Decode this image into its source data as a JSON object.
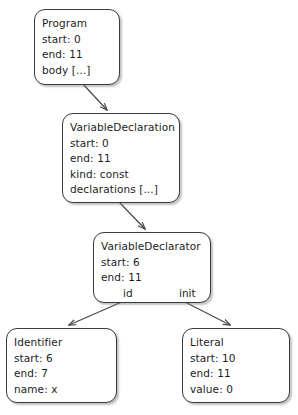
{
  "diagram": {
    "type": "abstract-syntax-tree",
    "title": "",
    "background_color": "#ffffff",
    "node_border_color": "#3a3a3a",
    "text_color": "#1c1c1c",
    "edge_color": "#4a4a4a",
    "nodes": [
      {
        "id": "program",
        "title": "Program",
        "lines": [
          "start: 0",
          "end: 11",
          "body [...]"
        ],
        "ports": []
      },
      {
        "id": "variable-declaration",
        "title": "VariableDeclaration",
        "lines": [
          "start: 0",
          "end: 11",
          "kind: const",
          "declarations [...]"
        ],
        "ports": []
      },
      {
        "id": "variable-declarator",
        "title": "VariableDeclarator",
        "lines": [
          "start: 6",
          "end: 11"
        ],
        "ports": [
          "id",
          "init"
        ]
      },
      {
        "id": "identifier",
        "title": "Identifier",
        "lines": [
          "start: 6",
          "end: 7",
          "name: x"
        ],
        "ports": []
      },
      {
        "id": "literal",
        "title": "Literal",
        "lines": [
          "start: 10",
          "end: 11",
          "value: 0"
        ],
        "ports": []
      }
    ],
    "edges": [
      {
        "from": "program",
        "to": "variable-declaration",
        "label": ""
      },
      {
        "from": "variable-declaration",
        "to": "variable-declarator",
        "label": ""
      },
      {
        "from": "variable-declarator",
        "to": "identifier",
        "label": "id"
      },
      {
        "from": "variable-declarator",
        "to": "literal",
        "label": "init"
      }
    ]
  }
}
